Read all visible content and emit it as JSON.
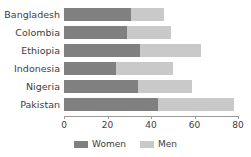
{
  "chart_data": {
    "type": "bar",
    "orientation": "horizontal",
    "stacked": true,
    "title": "",
    "xlabel": "",
    "ylabel": "",
    "xlim": [
      0,
      80
    ],
    "xticks": [
      0,
      20,
      40,
      60,
      80
    ],
    "grid": false,
    "legend_position": "bottom-center",
    "categories": [
      "Bangladesh",
      "Colombia",
      "Ethiopia",
      "Indonesia",
      "Nigeria",
      "Pakistan"
    ],
    "series": [
      {
        "name": "Women",
        "color": "#808080",
        "values": [
          31,
          29,
          35,
          24,
          34,
          43
        ]
      },
      {
        "name": "Men",
        "color": "#c9c9c9",
        "values": [
          15,
          20,
          28,
          26,
          25,
          35
        ]
      }
    ],
    "totals": [
      46,
      49,
      63,
      50,
      59,
      78
    ]
  },
  "axis": {
    "ticks": [
      {
        "label": "0",
        "value": 0
      },
      {
        "label": "20",
        "value": 20
      },
      {
        "label": "40",
        "value": 40
      },
      {
        "label": "60",
        "value": 60
      },
      {
        "label": "80",
        "value": 80
      }
    ]
  },
  "legend": {
    "items": [
      {
        "label": "Women",
        "color": "#808080"
      },
      {
        "label": "Men",
        "color": "#c9c9c9"
      }
    ]
  },
  "colors": {
    "women": "#808080",
    "men": "#c9c9c9",
    "axis": "#9a9a9a",
    "text": "#3d3d3d",
    "background": "#ffffff"
  }
}
